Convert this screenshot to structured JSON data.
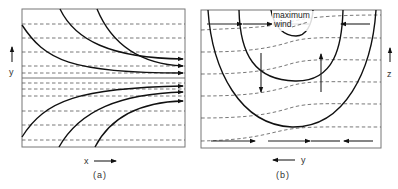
{
  "figure": {
    "panel_a": {
      "caption": "(a)",
      "x_axis_label": "x",
      "y_axis_label": "y",
      "x_arrow_direction": "right",
      "y_arrow_direction": "up",
      "description": "Confluent streamlines (solid, arrowed) converging toward the center line with dashed isotherms packing together"
    },
    "panel_b": {
      "caption": "(b)",
      "horizontal_axis_label": "y",
      "vertical_axis_label": "z",
      "horizontal_arrow_direction": "left",
      "vertical_arrow_direction": "up",
      "annotation": "maximum wind",
      "annotation_line1": "maximum",
      "annotation_line2": "wind",
      "description": "Cross section with nested U-shaped isotachs (solid), sloping dashed isentropes, and ageostrophic circulation arrows"
    },
    "colors": {
      "line": "#111111",
      "dashed": "#555555",
      "frame": "#777777",
      "background": "#ffffff"
    }
  }
}
